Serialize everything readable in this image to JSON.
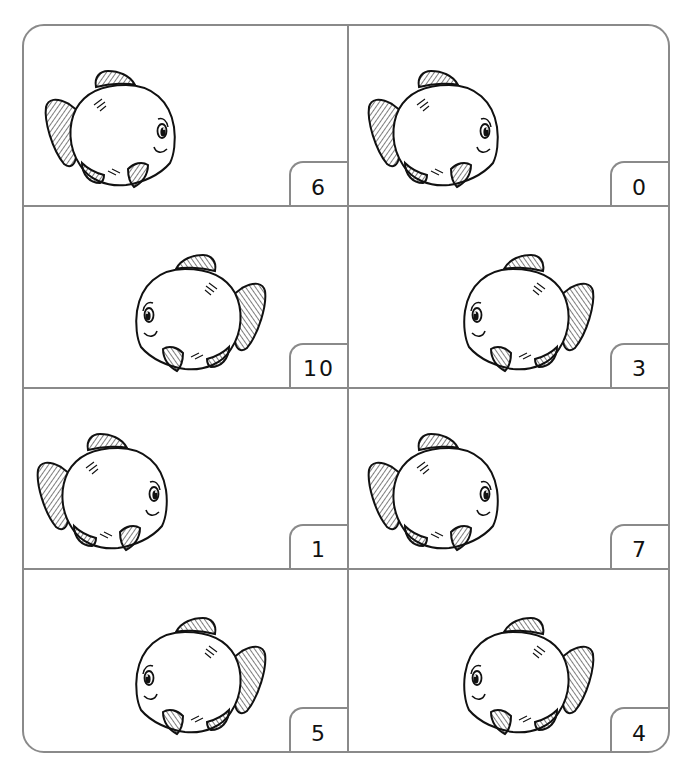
{
  "worksheet": {
    "layout": {
      "columns": 2,
      "rows": 4
    },
    "border_color": "#8a8a8a",
    "cells": [
      {
        "row": 0,
        "col": 0,
        "number": "6",
        "fish_facing": "right",
        "fish_icon": "fish-icon"
      },
      {
        "row": 0,
        "col": 1,
        "number": "0",
        "fish_facing": "right",
        "fish_icon": "fish-icon"
      },
      {
        "row": 1,
        "col": 0,
        "number": "10",
        "fish_facing": "left",
        "fish_icon": "fish-icon"
      },
      {
        "row": 1,
        "col": 1,
        "number": "3",
        "fish_facing": "left",
        "fish_icon": "fish-icon"
      },
      {
        "row": 2,
        "col": 0,
        "number": "1",
        "fish_facing": "right",
        "fish_icon": "fish-icon"
      },
      {
        "row": 2,
        "col": 1,
        "number": "7",
        "fish_facing": "right",
        "fish_icon": "fish-icon"
      },
      {
        "row": 3,
        "col": 0,
        "number": "5",
        "fish_facing": "left",
        "fish_icon": "fish-icon"
      },
      {
        "row": 3,
        "col": 1,
        "number": "4",
        "fish_facing": "left",
        "fish_icon": "fish-icon"
      }
    ]
  }
}
